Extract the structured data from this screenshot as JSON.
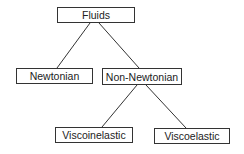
{
  "diagram": {
    "type": "tree",
    "nodes": [
      {
        "id": "fluids",
        "label": "Fluids",
        "x": 57,
        "y": 7,
        "w": 78,
        "h": 16
      },
      {
        "id": "newtonian",
        "label": "Newtonian",
        "x": 16,
        "y": 68,
        "w": 77,
        "h": 16
      },
      {
        "id": "non_newtonian",
        "label": "Non-Newtonian",
        "x": 102,
        "y": 68,
        "w": 80,
        "h": 17
      },
      {
        "id": "viscoinelastic",
        "label": "Viscoinelastic",
        "x": 55,
        "y": 127,
        "w": 78,
        "h": 16
      },
      {
        "id": "viscoelastic",
        "label": "Viscoelastic",
        "x": 154,
        "y": 128,
        "w": 76,
        "h": 16
      }
    ],
    "edges": [
      {
        "from": "fluids",
        "to": "newtonian",
        "x1": 90,
        "y1": 23,
        "x2": 57,
        "y2": 68
      },
      {
        "from": "fluids",
        "to": "non_newtonian",
        "x1": 99,
        "y1": 23,
        "x2": 139,
        "y2": 68
      },
      {
        "from": "non_newtonian",
        "to": "viscoinelastic",
        "x1": 137,
        "y1": 85,
        "x2": 102,
        "y2": 127
      },
      {
        "from": "non_newtonian",
        "to": "viscoelastic",
        "x1": 146,
        "y1": 85,
        "x2": 186,
        "y2": 128
      }
    ],
    "colors": {
      "line": "#333333",
      "border": "#333333",
      "text": "#222222",
      "background": "#ffffff"
    }
  }
}
